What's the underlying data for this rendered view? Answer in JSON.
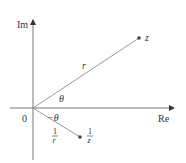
{
  "diagram": {
    "type": "complex-plane-reciprocal",
    "axes": {
      "imaginary_label": "Im",
      "real_label": "Re",
      "origin_label": "0"
    },
    "points": {
      "z": {
        "label": "z",
        "x": 139,
        "y": 38
      },
      "reciprocal": {
        "num": "1",
        "den": "z",
        "x": 80,
        "y": 137
      }
    },
    "labels": {
      "modulus": "r",
      "angle": "θ",
      "neg_angle": "−θ",
      "reciprocal_modulus_num": "1",
      "reciprocal_modulus_den": "r"
    },
    "colors": {
      "axis": "#555555",
      "vector": "#888888",
      "point": "#444444",
      "text": "#333333"
    }
  }
}
